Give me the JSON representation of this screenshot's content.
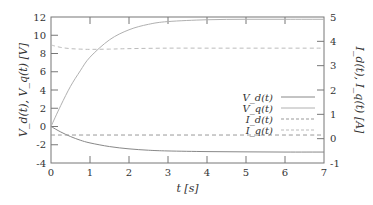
{
  "chart_data": {
    "type": "line",
    "title": "",
    "xlabel": "t [s]",
    "ylabel_left": "V_d(t), V_q(t) [V]",
    "ylabel_right": "I_d(t), I_q(t) [A]",
    "xlim": [
      0,
      7
    ],
    "ylim_left": [
      -4,
      12
    ],
    "ylim_right": [
      -1,
      5
    ],
    "x_ticks": [
      "0",
      "1",
      "2",
      "3",
      "4",
      "5",
      "6",
      "7"
    ],
    "y_ticks_left": [
      "-4",
      "-2",
      "0",
      "2",
      "4",
      "6",
      "8",
      "10",
      "12"
    ],
    "y_ticks_right": [
      "-1",
      "0",
      "1",
      "2",
      "3",
      "4",
      "5"
    ],
    "grid": false,
    "legend_position": "center-right",
    "series": [
      {
        "name": "V_d(t)",
        "axis": "left",
        "style": "solid",
        "color": "#888888",
        "x": [
          0,
          0.25,
          0.5,
          0.75,
          1,
          1.5,
          2,
          2.5,
          3,
          4,
          5,
          6,
          7
        ],
        "values": [
          0,
          -0.6,
          -1.1,
          -1.5,
          -1.8,
          -2.2,
          -2.45,
          -2.6,
          -2.68,
          -2.75,
          -2.78,
          -2.8,
          -2.8
        ]
      },
      {
        "name": "V_q(t)",
        "axis": "left",
        "style": "solid",
        "color": "#b0b0b0",
        "x": [
          0,
          0.25,
          0.5,
          0.75,
          1,
          1.5,
          2,
          2.5,
          3,
          4,
          5,
          6,
          7
        ],
        "values": [
          0,
          2.3,
          4.4,
          6.1,
          7.6,
          9.5,
          10.6,
          11.2,
          11.5,
          11.7,
          11.75,
          11.75,
          11.75
        ]
      },
      {
        "name": "I_d(t)",
        "axis": "right",
        "style": "dashed",
        "color": "#999999",
        "x": [
          0,
          1,
          2,
          3,
          4,
          5,
          6,
          7
        ],
        "values": [
          0.15,
          0.15,
          0.15,
          0.15,
          0.15,
          0.15,
          0.15,
          0.15
        ]
      },
      {
        "name": "I_q(t)",
        "axis": "right",
        "style": "dashed",
        "color": "#bbbbbb",
        "x": [
          0,
          0.25,
          0.5,
          0.75,
          1,
          1.5,
          2,
          3,
          4,
          5,
          6,
          7
        ],
        "values": [
          3.85,
          3.75,
          3.7,
          3.68,
          3.67,
          3.68,
          3.7,
          3.72,
          3.72,
          3.72,
          3.72,
          3.72
        ]
      }
    ]
  },
  "legend": {
    "items": [
      {
        "label": "V_d(t)",
        "style": "solid",
        "color": "#888888"
      },
      {
        "label": "V_q(t)",
        "style": "solid",
        "color": "#b0b0b0"
      },
      {
        "label": "I_d(t)",
        "style": "dashed",
        "color": "#999999"
      },
      {
        "label": "I_q(t)",
        "style": "dashed",
        "color": "#bbbbbb"
      }
    ]
  }
}
